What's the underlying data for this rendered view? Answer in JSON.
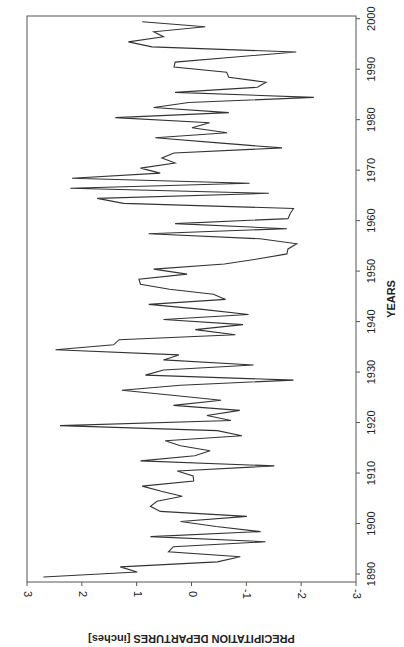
{
  "chart_data": {
    "type": "line",
    "orientation": "rotated-90-clockwise",
    "title": "",
    "xlabel": "YEARS",
    "ylabel": "PRECIPITATION DEPARTURES [inches]",
    "xlim": [
      1890,
      2000
    ],
    "ylim": [
      -3,
      3
    ],
    "x_ticks": [
      1890,
      1900,
      1910,
      1920,
      1930,
      1940,
      1950,
      1960,
      1970,
      1980,
      1990,
      2000
    ],
    "y_ticks": [
      3,
      2,
      1,
      0,
      -1,
      -2,
      -3
    ],
    "y_tick_labels": [
      "3",
      "2",
      "1",
      "0",
      "-1",
      "-2",
      "-3"
    ],
    "grid": false,
    "legend": "none",
    "series": [
      {
        "name": "Precipitation departure",
        "x": [
          1890,
          1891,
          1892,
          1893,
          1894,
          1895,
          1896,
          1897,
          1898,
          1899,
          1900,
          1901,
          1902,
          1903,
          1904,
          1905,
          1906,
          1907,
          1908,
          1909,
          1910,
          1911,
          1912,
          1913,
          1914,
          1915,
          1916,
          1917,
          1918,
          1919,
          1920,
          1921,
          1922,
          1923,
          1924,
          1925,
          1926,
          1927,
          1928,
          1929,
          1930,
          1931,
          1932,
          1933,
          1934,
          1935,
          1936,
          1937,
          1938,
          1939,
          1940,
          1941,
          1942,
          1943,
          1944,
          1945,
          1946,
          1947,
          1948,
          1949,
          1950,
          1951,
          1952,
          1953,
          1954,
          1955,
          1956,
          1957,
          1958,
          1959,
          1960,
          1961,
          1962,
          1963,
          1964,
          1965,
          1966,
          1967,
          1968,
          1969,
          1970,
          1971,
          1972,
          1973,
          1974,
          1975,
          1976,
          1977,
          1978,
          1979,
          1980,
          1981,
          1982,
          1983,
          1984,
          1985,
          1986,
          1987,
          1988,
          1989,
          1990,
          1991,
          1992,
          1993,
          1994,
          1995,
          1996,
          1997,
          1998,
          1999,
          2000
        ],
        "values": [
          2.7,
          0.99,
          1.3,
          -0.47,
          -0.89,
          0.42,
          0.33,
          -1.35,
          0.75,
          -1.26,
          -0.45,
          0.2,
          -1.01,
          0.57,
          0.75,
          0.63,
          0.17,
          0.55,
          0.9,
          -0.04,
          -0.03,
          0.26,
          -1.51,
          0.93,
          -0.06,
          -0.34,
          0.2,
          0.48,
          -0.92,
          -0.47,
          2.4,
          -0.72,
          -0.28,
          -0.88,
          0.33,
          -0.54,
          0.35,
          1.27,
          0.2,
          -1.86,
          0.84,
          0.51,
          -1.13,
          0.51,
          0.23,
          2.48,
          1.42,
          1.32,
          -0.8,
          -0.07,
          -0.94,
          0.51,
          -1.04,
          -0.2,
          0.78,
          -0.62,
          -0.4,
          0.4,
          0.93,
          0.96,
          0.08,
          0.69,
          -0.6,
          -1.2,
          -1.74,
          -1.76,
          -1.92,
          -1.25,
          0.78,
          -1.74,
          0.3,
          -1.76,
          -1.8,
          -1.86,
          1.24,
          1.72,
          -1.41,
          2.21,
          -1.06,
          2.18,
          0.57,
          0.93,
          0.3,
          0.54,
          0.32,
          -1.65,
          -0.49,
          0.66,
          -0.65,
          -0.01,
          -0.33,
          1.39,
          -0.68,
          0.69,
          0.05,
          -2.23,
          0.3,
          -1.2,
          -1.36,
          -0.68,
          -0.64,
          0.32,
          0.3,
          -0.8,
          -1.91,
          0.72,
          1.15,
          0.51,
          0.69,
          -0.25,
          0.9
        ]
      }
    ]
  }
}
